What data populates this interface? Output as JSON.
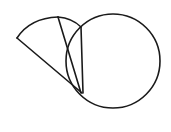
{
  "canvas": {
    "width": 171,
    "height": 132,
    "background_color": "#ffffff",
    "stroke_color": "#1a1a1a",
    "title": "Geometric Line Drawing"
  },
  "chart_data": {
    "type": "diagram",
    "shapes": [
      {
        "name": "circle",
        "kind": "circle",
        "center_x": 113,
        "center_y": 61,
        "radius": 47,
        "stroke_width": 1.6,
        "filled": false
      },
      {
        "name": "sector-long-edge",
        "kind": "line",
        "from_x": 82,
        "from_y": 93,
        "to_x": 17,
        "to_y": 38,
        "stroke_width": 1.6
      },
      {
        "name": "sector-arc-outer",
        "kind": "arc",
        "from_x": 17,
        "from_y": 38,
        "to_x": 58,
        "to_y": 17,
        "control_x": 30,
        "control_y": 18,
        "stroke_width": 1.6
      },
      {
        "name": "sector-arc-upper-right",
        "kind": "arc",
        "from_x": 58,
        "from_y": 17,
        "to_x": 81,
        "to_y": 27,
        "control_x": 72,
        "control_y": 18,
        "stroke_width": 1.6
      },
      {
        "name": "sector-inner-edge-left",
        "kind": "line",
        "from_x": 58,
        "from_y": 17,
        "to_x": 81,
        "to_y": 93,
        "stroke_width": 1.6
      },
      {
        "name": "sector-inner-edge-right",
        "kind": "line",
        "from_x": 81,
        "from_y": 27,
        "to_x": 83,
        "to_y": 93,
        "stroke_width": 1.6
      }
    ],
    "vertices": [
      {
        "name": "left-apex",
        "x": 17,
        "y": 38
      },
      {
        "name": "top-peak",
        "x": 58,
        "y": 17
      },
      {
        "name": "arc-circle-crossing",
        "x": 78,
        "y": 26
      },
      {
        "name": "sector-apex",
        "x": 82,
        "y": 93
      }
    ],
    "xlim": [
      0,
      171
    ],
    "ylim": [
      0,
      132
    ],
    "grid": false,
    "legend": null,
    "axis_visible": false
  }
}
